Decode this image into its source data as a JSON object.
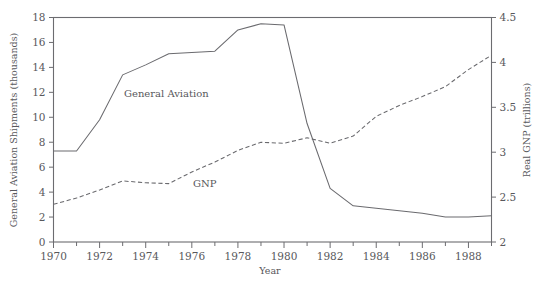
{
  "figure": {
    "ghost_header": "",
    "axes": {
      "xlabel": "Year",
      "ylabel_left": "General Aviation Shipments (thousands)",
      "ylabel_right": "Real GNP (trillions)",
      "x_ticks": [
        "1970",
        "1972",
        "1974",
        "1976",
        "1978",
        "1980",
        "1982",
        "1984",
        "1986",
        "1988"
      ],
      "y_ticks_left": [
        "18",
        "16",
        "14",
        "12",
        "10",
        "8",
        "6",
        "4",
        "2",
        "0"
      ],
      "y_ticks_right": [
        "4.5",
        "4",
        "3.5",
        "3",
        "2.5",
        "2"
      ]
    },
    "annotations": {
      "general_aviation_label": "General Aviation",
      "gnp_label": "GNP"
    },
    "colors": {
      "line": "#6a6a6e",
      "frame": "#6c6c70",
      "text": "#58585c",
      "background": "#ffffff"
    }
  },
  "chart_data": {
    "type": "line",
    "title": "",
    "xlabel": "Year",
    "ylabel": "General Aviation Shipments (thousands)",
    "ylabel_secondary": "Real GNP (trillions)",
    "xlim": [
      1970,
      1989
    ],
    "ylim": [
      0,
      18
    ],
    "ylim_secondary": [
      2,
      4.5
    ],
    "xticks": [
      1970,
      1972,
      1974,
      1976,
      1978,
      1980,
      1982,
      1984,
      1986,
      1988
    ],
    "xticks_minor": [
      1971,
      1973,
      1975,
      1977,
      1979,
      1981,
      1983,
      1985,
      1987,
      1989
    ],
    "yticks": [
      0,
      2,
      4,
      6,
      8,
      10,
      12,
      14,
      16,
      18
    ],
    "yticks_secondary": [
      2,
      2.5,
      3,
      3.5,
      4,
      4.5
    ],
    "grid": false,
    "legend": "inline-annotations",
    "x": [
      1970,
      1971,
      1972,
      1973,
      1974,
      1975,
      1976,
      1977,
      1978,
      1979,
      1980,
      1981,
      1982,
      1983,
      1984,
      1985,
      1986,
      1987,
      1988,
      1989
    ],
    "series": [
      {
        "name": "General Aviation",
        "axis": "left",
        "units": "thousands of shipments",
        "style": "solid",
        "values": [
          7.3,
          7.3,
          9.8,
          13.4,
          14.2,
          15.1,
          15.2,
          15.3,
          17.0,
          17.5,
          17.4,
          9.5,
          4.3,
          2.9,
          2.7,
          2.5,
          2.3,
          2.0,
          2.0,
          2.1
        ]
      },
      {
        "name": "GNP",
        "axis": "right",
        "units": "trillions of dollars",
        "style": "dashed",
        "values": [
          2.42,
          2.49,
          2.58,
          2.68,
          2.66,
          2.65,
          2.78,
          2.89,
          3.02,
          3.11,
          3.1,
          3.16,
          3.1,
          3.18,
          3.4,
          3.52,
          3.62,
          3.73,
          3.92,
          4.08
        ]
      }
    ],
    "annotations": [
      {
        "text": "General Aviation",
        "x": 1973.6,
        "y": 12.2,
        "series": "General Aviation"
      },
      {
        "text": "GNP",
        "x": 1977.0,
        "y": 5.4,
        "series": "GNP"
      }
    ]
  }
}
